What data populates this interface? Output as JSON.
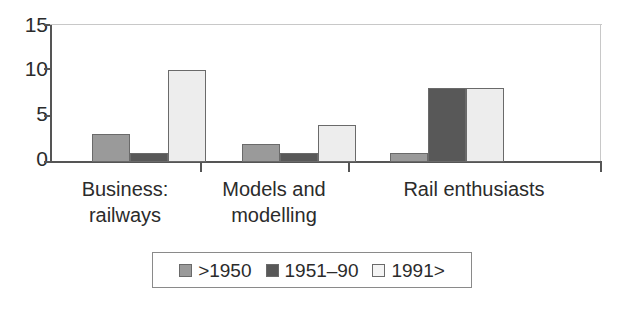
{
  "chart_data": {
    "type": "bar",
    "title": "",
    "subtitle": "",
    "xlabel": "",
    "ylabel": "",
    "ylim": [
      0,
      15
    ],
    "yticks": [
      0,
      5,
      10,
      15
    ],
    "ytick_labels": [
      "0",
      "5",
      "10",
      "15"
    ],
    "grid": false,
    "legend_position": "bottom",
    "categories": [
      "Business: railways",
      "Models and modelling",
      "Rail enthusiasts"
    ],
    "category_lines": [
      [
        "Business:",
        "railways"
      ],
      [
        "Models and",
        "modelling"
      ],
      [
        "Rail enthusiasts"
      ]
    ],
    "series": [
      {
        "name": ">1950",
        "color": "#9a9a9a",
        "values": [
          3,
          2,
          1
        ]
      },
      {
        "name": "1951–90",
        "color": "#585858",
        "values": [
          1,
          1,
          8
        ]
      },
      {
        "name": "1991>",
        "color": "#ededed",
        "values": [
          10,
          4,
          8
        ]
      }
    ]
  },
  "axes": {
    "y_ticks": [
      {
        "label": "15",
        "value": 15
      },
      {
        "label": "10",
        "value": 10
      },
      {
        "label": "5",
        "value": 5
      },
      {
        "label": "0",
        "value": 0
      }
    ]
  },
  "legend": {
    "entries": [
      {
        "label": ">1950",
        "swatch": "legend-swatch-1950"
      },
      {
        "label": "1951–90",
        "swatch": "legend-swatch-1951-90"
      },
      {
        "label": "1991>",
        "swatch": "legend-swatch-1991"
      }
    ]
  },
  "colors": {
    "series_0": "#9a9a9a",
    "series_1": "#585858",
    "series_2": "#ededed",
    "axis": "#555555",
    "text": "#2b2b2b",
    "frame": "#c8c8c8",
    "background": "#ffffff"
  }
}
